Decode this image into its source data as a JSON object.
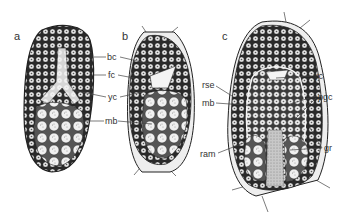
{
  "figure": {
    "panels": [
      {
        "id": "a",
        "letter": "a"
      },
      {
        "id": "b",
        "letter": "b"
      },
      {
        "id": "c",
        "letter": "c"
      }
    ],
    "labels_ab": {
      "bc": "bc",
      "fc": "fc",
      "yc": "yc",
      "mb": "mb"
    },
    "labels_c": {
      "rse": "rse",
      "mb": "mb",
      "ram": "ram",
      "yc": "yc",
      "pgc": "pgc",
      "gr": "gr"
    },
    "colors": {
      "ink": "#222222",
      "cell_fill": "#e8e8e8",
      "dark_tissue": "#2a2a2a",
      "pale_tissue": "#d8d8d8",
      "background": "#ffffff"
    }
  }
}
